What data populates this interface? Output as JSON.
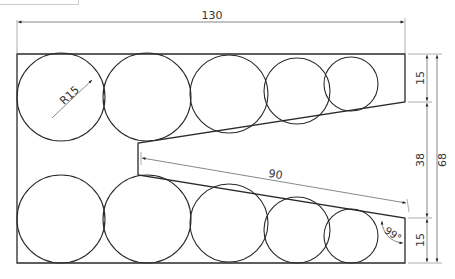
{
  "drawing": {
    "title": "2D technical drawing – plate with circles and V-notch",
    "outline": {
      "points": "17,54 405,54 405,102 138,143 138,175 405,218 405,263 17,263"
    },
    "circles": [
      {
        "cx": 61,
        "cy": 97,
        "r": 44
      },
      {
        "cx": 147,
        "cy": 97,
        "r": 44
      },
      {
        "cx": 229,
        "cy": 94,
        "r": 39
      },
      {
        "cx": 297,
        "cy": 91,
        "r": 33
      },
      {
        "cx": 351,
        "cy": 84,
        "r": 27
      },
      {
        "cx": 61,
        "cy": 219,
        "r": 44
      },
      {
        "cx": 147,
        "cy": 219,
        "r": 44
      },
      {
        "cx": 229,
        "cy": 223,
        "r": 39
      },
      {
        "cx": 297,
        "cy": 230,
        "r": 33
      },
      {
        "cx": 351,
        "cy": 236,
        "r": 27
      }
    ],
    "dimensions": {
      "overall_width": "130",
      "overall_height": "68",
      "notch_gap": "38",
      "top_right_height": "15",
      "bottom_right_height": "15",
      "notch_depth": "90",
      "radius": "R15",
      "angle": "99°"
    }
  }
}
